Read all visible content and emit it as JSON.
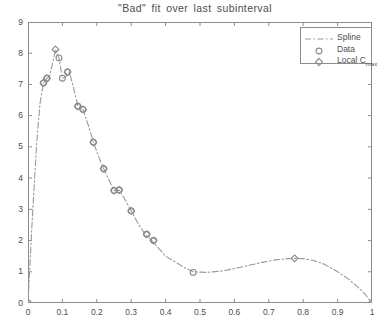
{
  "figure": {
    "title": "\"Bad\" fit over last subinterval",
    "background": "#ffffff",
    "axis_color": "#8c8c8c",
    "curve_color": "#999999",
    "marker_color": "#8a8a8a"
  },
  "legend": {
    "position": "top-right",
    "entries": [
      {
        "label": "Spline",
        "symbol": "dashdot-line"
      },
      {
        "label": "Data",
        "symbol": "circle-marker"
      },
      {
        "label": "Local C",
        "label_sub": "max",
        "symbol": "diamond-marker"
      }
    ]
  },
  "axes": {
    "x_ticks": [
      "0",
      "0.1",
      "0.2",
      "0.3",
      "0.4",
      "0.5",
      "0.6",
      "0.7",
      "0.8",
      "0.9",
      "1"
    ],
    "y_ticks": [
      "0",
      "1",
      "2",
      "3",
      "4",
      "5",
      "6",
      "7",
      "8",
      "9"
    ]
  },
  "chart_data": {
    "type": "line",
    "title": "\"Bad\" fit over last subinterval",
    "xlabel": "",
    "ylabel": "",
    "xlim": [
      0,
      1
    ],
    "ylim": [
      0,
      9
    ],
    "grid": false,
    "legend_position": "upper right",
    "series": [
      {
        "name": "Spline",
        "type": "line",
        "style": "dashdot",
        "color": "#999999",
        "x": [
          0.0,
          0.012,
          0.025,
          0.035,
          0.045,
          0.055,
          0.062,
          0.07,
          0.08,
          0.09,
          0.1,
          0.11,
          0.12,
          0.13,
          0.145,
          0.16,
          0.175,
          0.19,
          0.205,
          0.22,
          0.235,
          0.25,
          0.265,
          0.28,
          0.3,
          0.32,
          0.34,
          0.36,
          0.38,
          0.4,
          0.43,
          0.46,
          0.48,
          0.52,
          0.56,
          0.6,
          0.64,
          0.68,
          0.72,
          0.755,
          0.775,
          0.8,
          0.83,
          0.86,
          0.9,
          0.93,
          0.96,
          0.98,
          1.0
        ],
        "y": [
          0.0,
          2.6,
          5.1,
          6.4,
          7.05,
          7.2,
          7.25,
          7.6,
          8.12,
          7.85,
          7.2,
          7.25,
          7.4,
          7.0,
          6.3,
          6.2,
          5.7,
          5.15,
          4.7,
          4.3,
          3.95,
          3.6,
          3.62,
          3.35,
          2.95,
          2.55,
          2.2,
          2.0,
          1.75,
          1.5,
          1.3,
          1.1,
          1.0,
          0.98,
          1.02,
          1.1,
          1.2,
          1.3,
          1.38,
          1.42,
          1.43,
          1.42,
          1.36,
          1.25,
          1.0,
          0.78,
          0.5,
          0.28,
          0.0
        ]
      },
      {
        "name": "Data",
        "type": "scatter",
        "marker": "circle",
        "color": "#8a8a8a",
        "x": [
          0.0,
          0.045,
          0.055,
          0.09,
          0.1,
          0.115,
          0.145,
          0.16,
          0.19,
          0.22,
          0.25,
          0.265,
          0.3,
          0.345,
          0.365,
          0.48,
          1.0
        ],
        "y": [
          0.0,
          7.05,
          7.2,
          7.85,
          7.2,
          7.4,
          6.3,
          6.2,
          5.15,
          4.3,
          3.6,
          3.62,
          2.95,
          2.2,
          2.0,
          0.98,
          0.0
        ]
      },
      {
        "name": "Local C_max",
        "type": "scatter",
        "marker": "diamond",
        "color": "#8a8a8a",
        "x": [
          0.045,
          0.055,
          0.08,
          0.115,
          0.145,
          0.16,
          0.19,
          0.22,
          0.25,
          0.265,
          0.3,
          0.345,
          0.365,
          0.775
        ],
        "y": [
          7.05,
          7.2,
          8.12,
          7.4,
          6.3,
          6.2,
          5.15,
          4.3,
          3.6,
          3.62,
          2.95,
          2.2,
          2.0,
          1.43
        ]
      }
    ]
  }
}
